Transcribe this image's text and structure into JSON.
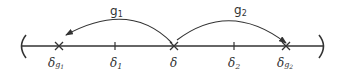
{
  "diagram": {
    "type": "number-line-with-mappings",
    "colors": {
      "ink": "#333333",
      "background": "#ffffff"
    },
    "interval": {
      "left_bracket": "(",
      "right_bracket": ")"
    },
    "points": [
      {
        "id": "dg1",
        "marker": "cross",
        "label_main": "δ",
        "label_sub_letter": "g",
        "label_sub_index": "1"
      },
      {
        "id": "d1",
        "marker": "tick",
        "label_main": "δ",
        "label_sub_letter": "",
        "label_sub_index": "1"
      },
      {
        "id": "d",
        "marker": "cross",
        "label_main": "δ",
        "label_sub_letter": "",
        "label_sub_index": ""
      },
      {
        "id": "d2",
        "marker": "tick",
        "label_main": "δ",
        "label_sub_letter": "",
        "label_sub_index": "2"
      },
      {
        "id": "dg2",
        "marker": "cross",
        "label_main": "δ",
        "label_sub_letter": "g",
        "label_sub_index": "2"
      }
    ],
    "arrows": [
      {
        "id": "g1",
        "from": "d",
        "to": "dg1",
        "label": "g",
        "label_index": "1"
      },
      {
        "id": "g2",
        "from": "d",
        "to": "dg2",
        "label": "g",
        "label_index": "2"
      }
    ]
  }
}
